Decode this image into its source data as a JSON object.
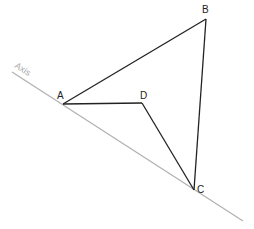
{
  "diagram": {
    "axis": {
      "label": "Axis",
      "color": "#b0b0b0",
      "start": [
        12,
        72
      ],
      "end": [
        243,
        221
      ]
    },
    "points": {
      "A": {
        "label": "A",
        "x": 63,
        "y": 104
      },
      "B": {
        "label": "B",
        "x": 206,
        "y": 19
      },
      "C": {
        "label": "C",
        "x": 194,
        "y": 190
      },
      "D": {
        "label": "D",
        "x": 142,
        "y": 103
      }
    },
    "segments": [
      [
        "A",
        "B"
      ],
      [
        "B",
        "C"
      ],
      [
        "A",
        "D"
      ],
      [
        "D",
        "C"
      ]
    ],
    "line_color": "#222222"
  }
}
